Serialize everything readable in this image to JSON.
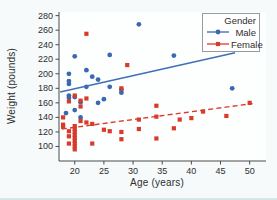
{
  "figure": {
    "background": "#f6fafb",
    "plot_background": "#fdfefe",
    "axis_color": "#4a4a4a",
    "tick_text_color": "#2e2e2e"
  },
  "chart_data": {
    "type": "scatter",
    "title": "",
    "xlabel": "Age (years)",
    "ylabel": "Weight (pounds)",
    "x_ticks": [
      20,
      25,
      30,
      35,
      40,
      45,
      50
    ],
    "y_ticks": [
      100,
      120,
      140,
      160,
      180,
      200,
      220,
      240,
      260,
      280
    ],
    "xlim": [
      17.3,
      52.8
    ],
    "ylim": [
      80,
      285
    ],
    "grid": false,
    "legend": {
      "title": "Gender",
      "position": "top-right",
      "entries": [
        {
          "label": "Male",
          "color": "#3a69b0",
          "marker": "circle",
          "line": "solid"
        },
        {
          "label": "Female",
          "color": "#d93b2b",
          "marker": "square",
          "line": "dashed"
        }
      ]
    },
    "series": [
      {
        "name": "Male",
        "marker": "circle",
        "color": "#3a69b0",
        "points": [
          [
            18.5,
            146
          ],
          [
            19,
            200
          ],
          [
            19,
            190
          ],
          [
            19,
            186
          ],
          [
            19,
            170
          ],
          [
            19,
            167
          ],
          [
            20,
            224
          ],
          [
            20,
            168
          ],
          [
            20,
            150
          ],
          [
            21,
            161
          ],
          [
            21,
            140
          ],
          [
            22,
            205
          ],
          [
            22,
            182
          ],
          [
            23,
            196
          ],
          [
            24,
            192
          ],
          [
            24,
            160
          ],
          [
            25,
            165
          ],
          [
            26,
            226
          ],
          [
            26,
            182
          ],
          [
            28,
            178
          ],
          [
            28,
            174
          ],
          [
            31,
            268
          ],
          [
            37,
            225
          ],
          [
            47,
            180
          ]
        ]
      },
      {
        "name": "Female",
        "marker": "square",
        "color": "#d93b2b",
        "points": [
          [
            18,
            140
          ],
          [
            18,
            130
          ],
          [
            18,
            127
          ],
          [
            19,
            162
          ],
          [
            19,
            121
          ],
          [
            19,
            114
          ],
          [
            19,
            104
          ],
          [
            20,
            170
          ],
          [
            20,
            128
          ],
          [
            20,
            124
          ],
          [
            20,
            120
          ],
          [
            20,
            116
          ],
          [
            20,
            112
          ],
          [
            20,
            108
          ],
          [
            20,
            104
          ],
          [
            20,
            100
          ],
          [
            20,
            96
          ],
          [
            21,
            163
          ],
          [
            21,
            155
          ],
          [
            21,
            135
          ],
          [
            22,
            255
          ],
          [
            22,
            166
          ],
          [
            22,
            133
          ],
          [
            23,
            131
          ],
          [
            23,
            104
          ],
          [
            25,
            123
          ],
          [
            26,
            121
          ],
          [
            28,
            180
          ],
          [
            28,
            120
          ],
          [
            28,
            110
          ],
          [
            29,
            212
          ],
          [
            31,
            137
          ],
          [
            31,
            124
          ],
          [
            34,
            156
          ],
          [
            34,
            141
          ],
          [
            34,
            111
          ],
          [
            37,
            125
          ],
          [
            38,
            137
          ],
          [
            40,
            139
          ],
          [
            42,
            148
          ],
          [
            46,
            142
          ],
          [
            50,
            160
          ]
        ]
      }
    ],
    "trend_lines": [
      {
        "series": "Male",
        "style": "solid",
        "color": "#3f6fb5",
        "from": [
          17.5,
          175
        ],
        "to": [
          47.5,
          229
        ]
      },
      {
        "series": "Female",
        "style": "dashed",
        "color": "#d93b2b",
        "from": [
          17.8,
          124
        ],
        "to": [
          50.5,
          159
        ]
      }
    ]
  }
}
